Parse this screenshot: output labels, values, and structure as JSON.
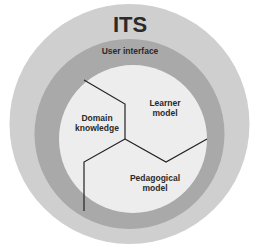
{
  "diagram": {
    "title": "ITS",
    "rings": {
      "outer": {
        "label": "ITS",
        "color": "#cfcfcf"
      },
      "middle": {
        "label": "User interface",
        "color": "#a9a9a9"
      },
      "inner": {
        "color": "#ededed"
      }
    },
    "segments": {
      "domain": {
        "line1": "Domain",
        "line2": "knowledge"
      },
      "learner": {
        "line1": "Learner",
        "line2": "model"
      },
      "pedagogical": {
        "line1": "Pedagogical",
        "line2": "model"
      }
    },
    "divider_color": "#222222"
  }
}
